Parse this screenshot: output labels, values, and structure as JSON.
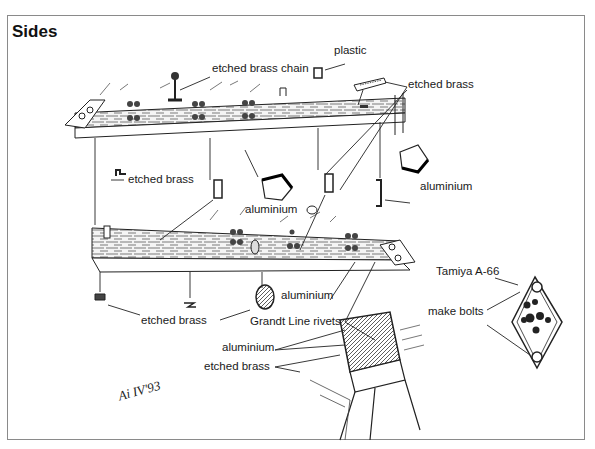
{
  "title": "Sides",
  "labels": {
    "etched_brass_chain": "etched brass chain",
    "plastic": "plastic",
    "etched_brass_top_right": "etched brass",
    "etched_brass_left": "etched brass",
    "aluminium_center": "aluminium",
    "aluminium_right": "aluminium",
    "tamiya": "Tamiya A-66",
    "make_bolts": "make bolts",
    "etched_brass_bottom": "etched brass",
    "aluminium_bottom": "aluminium",
    "grandt_line_rivets": "Grandt Line rivets",
    "aluminium_lower": "aluminium",
    "etched_brass_lower": "etched brass"
  },
  "signature": "Ai IV'93",
  "colors": {
    "ink": "#1a1a1a",
    "frame": "#8a8a8a",
    "background": "#ffffff"
  }
}
